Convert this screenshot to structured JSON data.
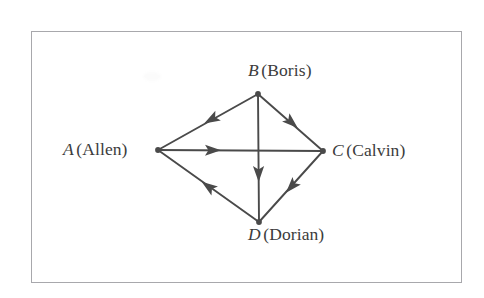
{
  "figure": {
    "kind": "directed-graph",
    "background_color": "#ffffff",
    "frame_color": "#a8a8ac",
    "stroke_color": "#4a4a4a",
    "text_color": "#3c3c3c"
  },
  "nodes": [
    {
      "id": "A",
      "letter": "A",
      "name": "(Allen)",
      "x": 158,
      "y": 150,
      "label_position": "left"
    },
    {
      "id": "B",
      "letter": "B",
      "name": "(Boris)",
      "x": 258,
      "y": 94,
      "label_position": "above"
    },
    {
      "id": "C",
      "letter": "C",
      "name": "(Calvin)",
      "x": 323,
      "y": 151,
      "label_position": "right"
    },
    {
      "id": "D",
      "letter": "D",
      "name": "(Dorian)",
      "x": 259,
      "y": 222,
      "label_position": "below"
    }
  ],
  "edges": [
    {
      "id": "b-a",
      "from": "B",
      "to": "A",
      "arrow": "mid",
      "direction": "down-left"
    },
    {
      "id": "b-c",
      "from": "B",
      "to": "C",
      "arrow": "mid",
      "direction": "down-right"
    },
    {
      "id": "b-d",
      "from": "B",
      "to": "D",
      "arrow": "mid",
      "direction": "down"
    },
    {
      "id": "a-c",
      "from": "A",
      "to": "C",
      "arrow": "mid",
      "direction": "right"
    },
    {
      "id": "d-a",
      "from": "D",
      "to": "A",
      "arrow": "mid",
      "direction": "up-left"
    },
    {
      "id": "c-d",
      "from": "C",
      "to": "D",
      "arrow": "mid",
      "direction": "down-left"
    }
  ]
}
